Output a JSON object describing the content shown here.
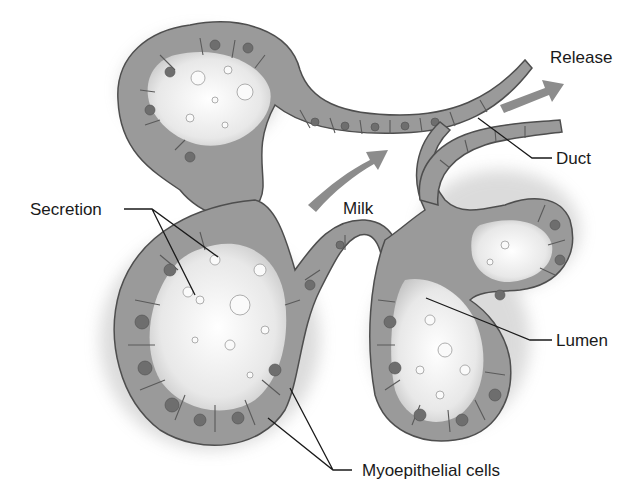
{
  "figure": {
    "style": "grayscale anatomical illustration",
    "colors": {
      "background": "#ffffff",
      "tissue": "#9a9a9a",
      "tissue_outline": "#4e4e4e",
      "nucleus": "#6e6e6e",
      "lumen": "#f4f4f4",
      "arrow": "#8c8c8c",
      "label_text": "#1a1a1a"
    }
  },
  "labels": {
    "secretion": "Secretion",
    "milk": "Milk",
    "release": "Release",
    "duct": "Duct",
    "lumen": "Lumen",
    "myoepithelial": "Myoepithelial cells"
  },
  "arrows": [
    {
      "name": "milk-flow-arrow",
      "direction": "up-right"
    },
    {
      "name": "release-arrow",
      "direction": "up-right"
    }
  ]
}
